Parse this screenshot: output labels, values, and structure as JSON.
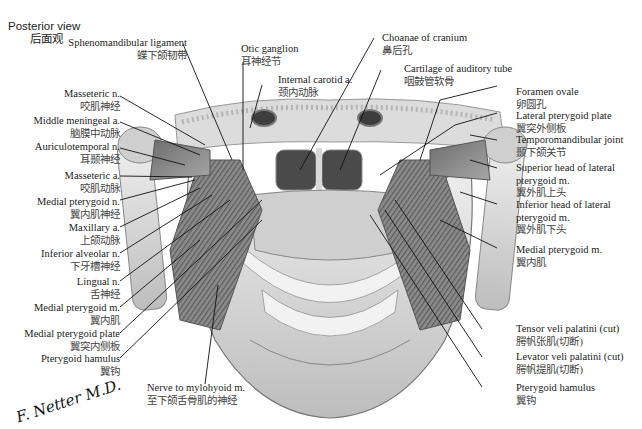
{
  "figure": {
    "view_title": "Posterior view",
    "view_title_zh": "后面观",
    "signature": "F. Netter M.D."
  },
  "labels_left": [
    {
      "en": "Sphenomandibular ligament",
      "zh": "蝶下颌韧带"
    },
    {
      "en": "Masseteric n.",
      "zh": "咬肌神经"
    },
    {
      "en": "Middle meningeal a.",
      "zh": "脑膜中动脉"
    },
    {
      "en": "Auriculotemporal n.",
      "zh": "耳颞神经"
    },
    {
      "en": "Masseteric a.",
      "zh": "咬肌动脉"
    },
    {
      "en": "Medial pterygoid n.",
      "zh": "翼内肌神经"
    },
    {
      "en": "Maxillary a.",
      "zh": "上颌动脉"
    },
    {
      "en": "Inferior alveolar n.",
      "zh": "下牙槽神经"
    },
    {
      "en": "Lingual n.",
      "zh": "舌神经"
    },
    {
      "en": "Medial pterygoid m.",
      "zh": "翼内肌"
    },
    {
      "en": "Medial pterygoid plate",
      "zh": "翼突内侧板"
    },
    {
      "en": "Pterygoid hamulus",
      "zh": "翼钩"
    }
  ],
  "labels_top": [
    {
      "en": "Otic ganglion",
      "zh": "耳神经节"
    },
    {
      "en": "Internal carotid a.",
      "zh": "颈内动脉"
    },
    {
      "en": "Choanae of cranium",
      "zh": "鼻后孔"
    },
    {
      "en": "Cartilage of auditory tube",
      "zh": "咽鼓管软骨"
    }
  ],
  "labels_right": [
    {
      "en": "Foramen ovale",
      "zh": "卵圆孔"
    },
    {
      "en": "Lateral pterygoid plate",
      "zh": "翼突外侧板"
    },
    {
      "en": "Temporomandibular joint",
      "zh": "颞下颌关节"
    },
    {
      "en": "Superior head of lateral",
      "en2": "pterygoid m.",
      "zh": "翼外肌上头"
    },
    {
      "en": "Inferior head of lateral",
      "en2": "pterygoid m.",
      "zh": "翼外肌下头"
    },
    {
      "en": "Medial pterygoid m.",
      "zh": "翼内肌"
    },
    {
      "en": "Tensor veli palatini (cut)",
      "zh": "腭帆张肌(切断)"
    },
    {
      "en": "Levator veli palatini (cut)",
      "zh": "腭帆提肌(切断)"
    },
    {
      "en": "Pterygoid hamulus",
      "zh": "翼钩"
    }
  ],
  "labels_bottom": [
    {
      "en": "Nerve to mylohyoid m.",
      "zh": "至下颌舌骨肌的神经"
    }
  ],
  "colors": {
    "bone": "#e4e4e4",
    "bone_shadow": "#9a9a9a",
    "muscle": "#8a8a8a",
    "dark": "#3a3a3a",
    "leader": "#111111"
  }
}
